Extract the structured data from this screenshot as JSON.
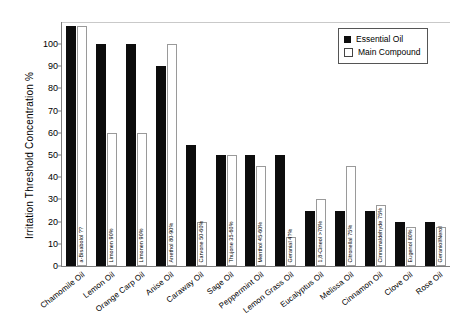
{
  "chart_data": {
    "type": "bar",
    "title": "",
    "xlabel": "",
    "ylabel": "Irritation Threshold Concentration %",
    "ylim": [
      0,
      100
    ],
    "ytick_labels": [
      "0",
      "10",
      "20",
      "30",
      "40",
      "50",
      "60",
      "70",
      "80",
      "90",
      "100"
    ],
    "ytick_values": [
      0,
      10,
      20,
      30,
      40,
      50,
      60,
      70,
      80,
      90,
      100
    ],
    "grid": false,
    "legend_position": "top-right",
    "categories": [
      "Chamomile Oil",
      "Lemon Oil",
      "Orange Carp Oil",
      "Anise Oil",
      "Caraway Oil",
      "Sage Oil",
      "Peppermint Oil",
      "Lemon Grass Oil",
      "Eucalyptus Oil",
      "Melissa Oil",
      "Cinnamon Oil",
      "Clove Oil",
      "Rose Oil"
    ],
    "series": [
      {
        "name": "Essential Oil",
        "color": "#0d0d0d",
        "values": [
          108,
          100,
          100,
          90,
          54.5,
          50,
          50,
          50,
          25,
          25,
          25,
          20,
          20
        ]
      },
      {
        "name": "Main Compound",
        "color": "#ffffff",
        "values": [
          108,
          60,
          60,
          100,
          20,
          50,
          45,
          13,
          30,
          45,
          27.5,
          17.5,
          17.5
        ]
      }
    ],
    "compound_labels": [
      "a-Bisabolol ??",
      "Limonen 90%",
      "Limonen 90%",
      "Anethol 80-90%",
      "Carvone 50-60%",
      "Thujone 35-60%",
      "Menthol 45-60%",
      "Geranial 4?%",
      "1,8-Cineol >70%",
      "Citronellal 75%",
      "Cinnamaldehyde 75%",
      "Eugenol 80%",
      "Geraniol/Nerol"
    ]
  },
  "legend": {
    "items": [
      {
        "label": "Essential Oil",
        "marker": "filled-square"
      },
      {
        "label": "Main Compound",
        "marker": "hollow-square"
      }
    ]
  }
}
